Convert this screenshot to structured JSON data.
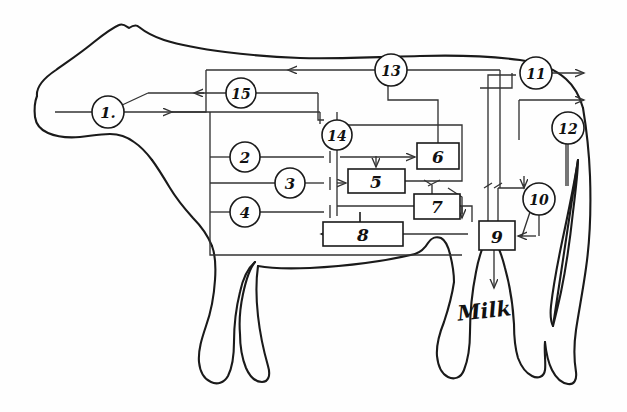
{
  "diagram": {
    "animal_outline": "cow-silhouette-side-view",
    "output_label": "Milk",
    "circled_nodes": [
      {
        "id": "n1",
        "label": "1.",
        "cx": 108,
        "cy": 112
      },
      {
        "id": "n2",
        "label": "2",
        "cx": 245,
        "cy": 157
      },
      {
        "id": "n3",
        "label": "3",
        "cx": 290,
        "cy": 183
      },
      {
        "id": "n4",
        "label": "4",
        "cx": 245,
        "cy": 212
      },
      {
        "id": "n10",
        "label": "10",
        "cx": 539,
        "cy": 199
      },
      {
        "id": "n11",
        "label": "11",
        "cx": 536,
        "cy": 73
      },
      {
        "id": "n12",
        "label": "12",
        "cx": 568,
        "cy": 128
      },
      {
        "id": "n13",
        "label": "13",
        "cx": 391,
        "cy": 70
      },
      {
        "id": "n14",
        "label": "14",
        "cx": 337,
        "cy": 135
      },
      {
        "id": "n15",
        "label": "15",
        "cx": 241,
        "cy": 93
      }
    ],
    "boxed_nodes": [
      {
        "id": "b5",
        "label": "5",
        "x": 348,
        "y": 169,
        "w": 57,
        "h": 24
      },
      {
        "id": "b6",
        "label": "6",
        "x": 417,
        "y": 143,
        "w": 42,
        "h": 26
      },
      {
        "id": "b7",
        "label": "7",
        "x": 414,
        "y": 194,
        "w": 46,
        "h": 25
      },
      {
        "id": "b8",
        "label": "8",
        "x": 323,
        "y": 222,
        "w": 80,
        "h": 24
      },
      {
        "id": "b9",
        "label": "9",
        "x": 479,
        "y": 221,
        "w": 36,
        "h": 29
      }
    ],
    "colors": {
      "ink": "#1a1a1a",
      "line": "#333333",
      "background": "#ffffff"
    }
  }
}
